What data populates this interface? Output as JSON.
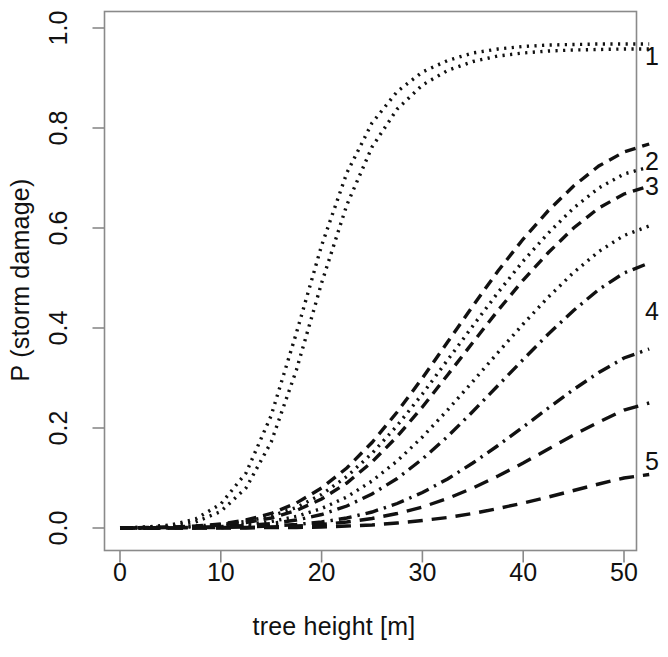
{
  "chart_data": {
    "type": "line",
    "title": "",
    "xlabel": "tree height [m]",
    "ylabel": "P (storm damage)",
    "xlim": [
      0,
      52.5
    ],
    "ylim": [
      0.0,
      1.0
    ],
    "xticks": [
      "0",
      "10",
      "20",
      "30",
      "40",
      "50"
    ],
    "xtick_values": [
      0,
      10,
      20,
      30,
      40,
      50
    ],
    "yticks": [
      "0.0",
      "0.2",
      "0.4",
      "0.6",
      "0.8",
      "1.0"
    ],
    "ytick_values": [
      0.0,
      0.2,
      0.4,
      0.6,
      0.8,
      1.0
    ],
    "grid": false,
    "legend": "right-edge-curve-labels",
    "x": [
      0,
      2.5,
      5,
      7.5,
      10,
      12.5,
      15,
      17.5,
      20,
      22.5,
      25,
      27.5,
      30,
      32.5,
      35,
      37.5,
      40,
      42.5,
      45,
      47.5,
      50,
      52.5
    ],
    "series": [
      {
        "name": "1a",
        "label": "",
        "style": "dotted",
        "values": [
          0.0,
          0.002,
          0.006,
          0.018,
          0.048,
          0.11,
          0.225,
          0.39,
          0.565,
          0.71,
          0.81,
          0.873,
          0.912,
          0.935,
          0.95,
          0.958,
          0.963,
          0.966,
          0.967,
          0.968,
          0.968,
          0.968
        ]
      },
      {
        "name": "1b",
        "label": "1",
        "style": "dotted",
        "values": [
          0.0,
          0.001,
          0.004,
          0.012,
          0.033,
          0.08,
          0.172,
          0.316,
          0.49,
          0.646,
          0.762,
          0.838,
          0.886,
          0.915,
          0.933,
          0.944,
          0.95,
          0.954,
          0.956,
          0.957,
          0.958,
          0.958
        ]
      },
      {
        "name": "2",
        "label": "2",
        "style": "dashed",
        "values": [
          0.0,
          0.001,
          0.002,
          0.004,
          0.008,
          0.016,
          0.029,
          0.05,
          0.08,
          0.12,
          0.171,
          0.232,
          0.3,
          0.372,
          0.444,
          0.514,
          0.578,
          0.635,
          0.684,
          0.724,
          0.752,
          0.768
        ]
      },
      {
        "name": "3a",
        "label": "",
        "style": "dotted",
        "values": [
          0.0,
          0.001,
          0.002,
          0.004,
          0.007,
          0.013,
          0.024,
          0.041,
          0.067,
          0.103,
          0.149,
          0.205,
          0.268,
          0.336,
          0.404,
          0.471,
          0.534,
          0.59,
          0.64,
          0.68,
          0.708,
          0.722
        ]
      },
      {
        "name": "3b",
        "label": "3",
        "style": "dashed",
        "values": [
          0.0,
          0.0,
          0.001,
          0.003,
          0.006,
          0.011,
          0.02,
          0.035,
          0.058,
          0.09,
          0.132,
          0.183,
          0.242,
          0.306,
          0.371,
          0.435,
          0.496,
          0.551,
          0.6,
          0.64,
          0.668,
          0.684
        ]
      },
      {
        "name": "3c",
        "label": "",
        "style": "dotted",
        "values": [
          0.0,
          0.0,
          0.001,
          0.002,
          0.004,
          0.007,
          0.013,
          0.023,
          0.039,
          0.062,
          0.094,
          0.134,
          0.182,
          0.236,
          0.293,
          0.351,
          0.408,
          0.462,
          0.511,
          0.553,
          0.585,
          0.604
        ]
      },
      {
        "name": "4a",
        "label": "4",
        "style": "dashdot",
        "values": [
          0.0,
          0.0,
          0.001,
          0.001,
          0.003,
          0.005,
          0.009,
          0.016,
          0.027,
          0.044,
          0.068,
          0.099,
          0.138,
          0.183,
          0.233,
          0.285,
          0.337,
          0.388,
          0.435,
          0.477,
          0.51,
          0.53
        ]
      },
      {
        "name": "4b",
        "label": "",
        "style": "dashdot",
        "values": [
          0.0,
          0.0,
          0.0,
          0.001,
          0.001,
          0.002,
          0.004,
          0.007,
          0.012,
          0.02,
          0.032,
          0.049,
          0.071,
          0.098,
          0.13,
          0.165,
          0.202,
          0.24,
          0.277,
          0.311,
          0.34,
          0.358
        ]
      },
      {
        "name": "5a",
        "label": "5",
        "style": "longdash",
        "values": [
          0.0,
          0.0,
          0.0,
          0.0,
          0.001,
          0.001,
          0.002,
          0.004,
          0.007,
          0.012,
          0.019,
          0.029,
          0.042,
          0.059,
          0.08,
          0.104,
          0.13,
          0.158,
          0.186,
          0.212,
          0.236,
          0.25
        ]
      },
      {
        "name": "5b",
        "label": "",
        "style": "longdash",
        "values": [
          0.0,
          0.0,
          0.0,
          0.0,
          0.0,
          0.0,
          0.001,
          0.001,
          0.002,
          0.004,
          0.006,
          0.01,
          0.015,
          0.021,
          0.029,
          0.039,
          0.05,
          0.062,
          0.075,
          0.088,
          0.1,
          0.107
        ]
      }
    ],
    "curve_labels": [
      {
        "text": "1",
        "y_value": 0.945
      },
      {
        "text": "2",
        "y_value": 0.735
      },
      {
        "text": "3",
        "y_value": 0.685
      },
      {
        "text": "4",
        "y_value": 0.435
      },
      {
        "text": "5",
        "y_value": 0.135
      }
    ]
  }
}
